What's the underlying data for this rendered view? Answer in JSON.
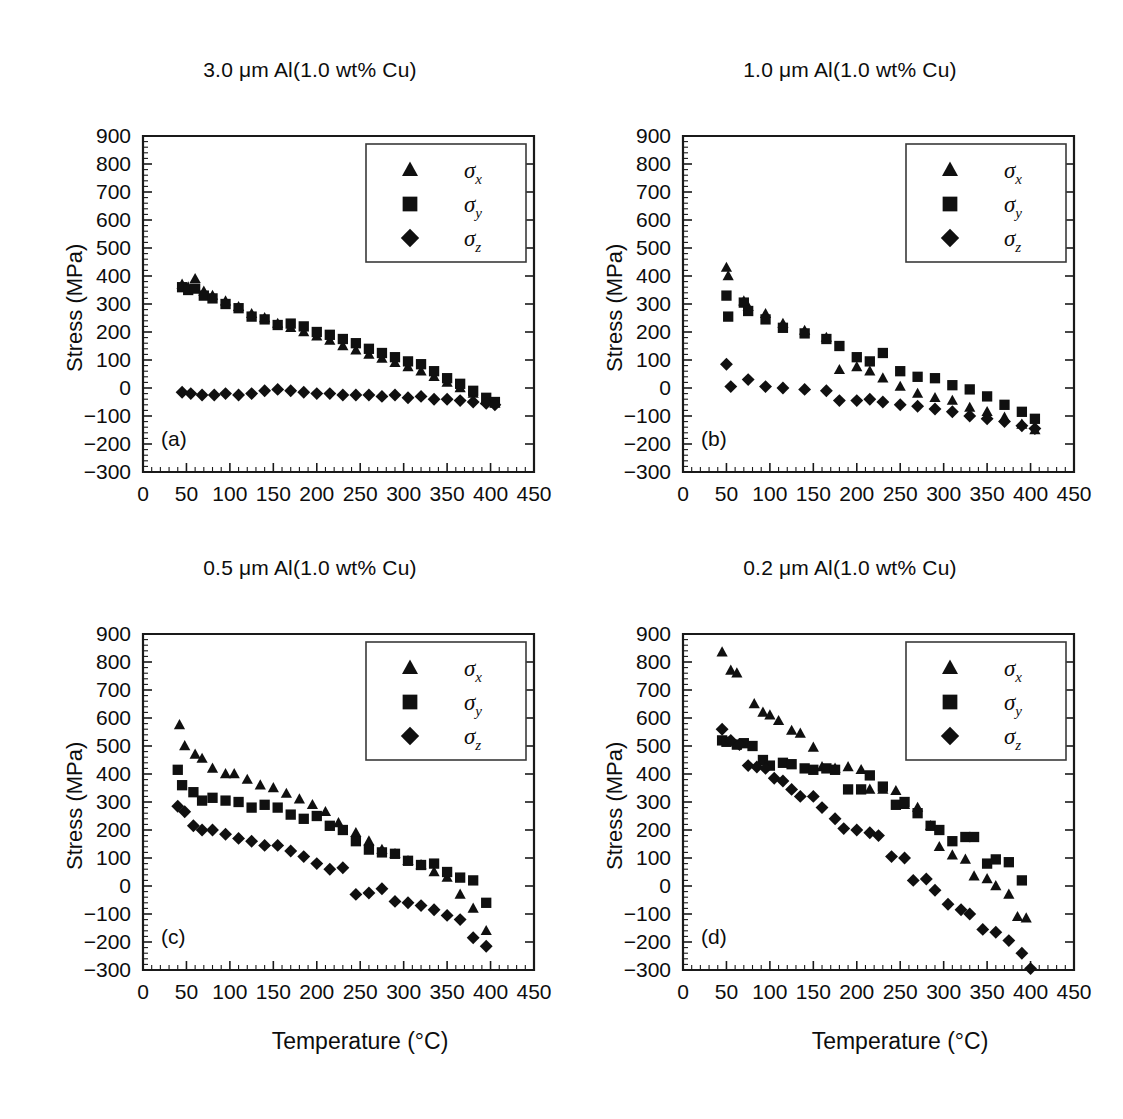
{
  "figure": {
    "background": "#ffffff",
    "marker_color": "#101010",
    "axis_color": "#1a1a1a"
  },
  "axes": {
    "xlabel": "Temperature (°C)",
    "ylabel": "Stress (MPa)",
    "xticks": [
      0,
      50,
      100,
      150,
      200,
      250,
      300,
      350,
      400,
      450
    ],
    "yticks": [
      900,
      800,
      700,
      600,
      500,
      400,
      300,
      200,
      100,
      0,
      -100,
      -200,
      -300
    ],
    "xlim": [
      0,
      450
    ],
    "ylim": [
      -300,
      900
    ],
    "xminor_per_major": 5,
    "yminor_per_major": 5,
    "grid": false
  },
  "legend": {
    "position": "top-right",
    "entries": [
      {
        "marker": "triangle",
        "symbol": "σ",
        "subscript": "x",
        "label": "σx"
      },
      {
        "marker": "square",
        "symbol": "σ",
        "subscript": "y",
        "label": "σy"
      },
      {
        "marker": "diamond",
        "symbol": "σ",
        "subscript": "z",
        "label": "σz"
      }
    ]
  },
  "panels": [
    {
      "letter": "(a)",
      "title": "3.0 μm Al(1.0 wt% Cu)"
    },
    {
      "letter": "(b)",
      "title": "1.0 μm Al(1.0 wt% Cu)"
    },
    {
      "letter": "(c)",
      "title": "0.5 μm Al(1.0 wt% Cu)"
    },
    {
      "letter": "(d)",
      "title": "0.2 μm Al(1.0 wt% Cu)"
    }
  ],
  "chart_data": [
    {
      "type": "scatter",
      "panel": "(a)",
      "title": "3.0 μm Al(1.0 wt% Cu)",
      "xlabel": "Temperature (°C)",
      "ylabel": "Stress (MPa)",
      "xlim": [
        0,
        450
      ],
      "ylim": [
        -300,
        900
      ],
      "legend": [
        "σx",
        "σy",
        "σz"
      ],
      "series": [
        {
          "name": "σx",
          "marker": "triangle",
          "x": [
            45,
            52,
            60,
            70,
            80,
            95,
            110,
            125,
            140,
            155,
            170,
            185,
            200,
            215,
            230,
            245,
            260,
            275,
            290,
            305,
            320,
            335,
            350,
            365,
            380,
            395,
            405
          ],
          "y": [
            370,
            360,
            390,
            345,
            330,
            310,
            290,
            265,
            250,
            230,
            215,
            200,
            185,
            170,
            150,
            135,
            120,
            105,
            90,
            75,
            60,
            40,
            20,
            0,
            -20,
            -45,
            -55
          ]
        },
        {
          "name": "σy",
          "marker": "square",
          "x": [
            45,
            52,
            60,
            70,
            80,
            95,
            110,
            125,
            140,
            155,
            170,
            185,
            200,
            215,
            230,
            245,
            260,
            275,
            290,
            305,
            320,
            335,
            350,
            365,
            380,
            395,
            405
          ],
          "y": [
            360,
            350,
            355,
            330,
            320,
            300,
            285,
            255,
            245,
            225,
            230,
            220,
            200,
            190,
            175,
            160,
            140,
            125,
            110,
            95,
            85,
            60,
            35,
            15,
            -10,
            -35,
            -50
          ]
        },
        {
          "name": "σz",
          "marker": "diamond",
          "x": [
            45,
            55,
            68,
            82,
            95,
            110,
            125,
            140,
            155,
            170,
            185,
            200,
            215,
            230,
            245,
            260,
            275,
            290,
            305,
            320,
            335,
            350,
            365,
            380,
            395,
            405
          ],
          "y": [
            -15,
            -20,
            -25,
            -25,
            -20,
            -25,
            -20,
            -10,
            -5,
            -10,
            -15,
            -20,
            -20,
            -25,
            -25,
            -25,
            -30,
            -25,
            -35,
            -30,
            -40,
            -40,
            -45,
            -50,
            -55,
            -60
          ]
        }
      ]
    },
    {
      "type": "scatter",
      "panel": "(b)",
      "title": "1.0 μm Al(1.0 wt% Cu)",
      "xlabel": "Temperature (°C)",
      "ylabel": "Stress (MPa)",
      "xlim": [
        0,
        450
      ],
      "ylim": [
        -300,
        900
      ],
      "legend": [
        "σx",
        "σy",
        "σz"
      ],
      "series": [
        {
          "name": "σx",
          "marker": "triangle",
          "x": [
            50,
            52,
            70,
            75,
            95,
            115,
            140,
            165,
            180,
            200,
            215,
            230,
            250,
            270,
            290,
            310,
            330,
            350,
            370,
            390,
            405
          ],
          "y": [
            430,
            400,
            310,
            290,
            265,
            230,
            205,
            180,
            65,
            75,
            60,
            35,
            5,
            -20,
            -35,
            -45,
            -70,
            -85,
            -105,
            -130,
            -150
          ]
        },
        {
          "name": "σy",
          "marker": "square",
          "x": [
            50,
            52,
            70,
            75,
            95,
            115,
            140,
            165,
            180,
            200,
            215,
            230,
            250,
            270,
            290,
            310,
            330,
            350,
            370,
            390,
            405
          ],
          "y": [
            330,
            255,
            305,
            275,
            245,
            215,
            195,
            175,
            150,
            110,
            95,
            125,
            60,
            40,
            35,
            10,
            -5,
            -30,
            -60,
            -85,
            -110
          ]
        },
        {
          "name": "σz",
          "marker": "diamond",
          "x": [
            50,
            55,
            75,
            95,
            115,
            140,
            165,
            180,
            200,
            215,
            230,
            250,
            270,
            290,
            310,
            330,
            350,
            370,
            390,
            405
          ],
          "y": [
            85,
            5,
            30,
            5,
            0,
            -5,
            -10,
            -45,
            -45,
            -40,
            -50,
            -60,
            -65,
            -75,
            -85,
            -100,
            -110,
            -120,
            -135,
            -145
          ]
        }
      ]
    },
    {
      "type": "scatter",
      "panel": "(c)",
      "title": "0.5 μm Al(1.0 wt% Cu)",
      "xlabel": "Temperature (°C)",
      "ylabel": "Stress (MPa)",
      "xlim": [
        0,
        450
      ],
      "ylim": [
        -300,
        900
      ],
      "legend": [
        "σx",
        "σy",
        "σz"
      ],
      "series": [
        {
          "name": "σx",
          "marker": "triangle",
          "x": [
            42,
            48,
            60,
            68,
            80,
            95,
            105,
            120,
            135,
            150,
            165,
            180,
            195,
            210,
            225,
            245,
            260,
            275,
            290,
            305,
            320,
            335,
            350,
            365,
            380,
            395
          ],
          "y": [
            575,
            500,
            470,
            455,
            420,
            400,
            400,
            380,
            360,
            350,
            330,
            310,
            290,
            265,
            225,
            190,
            160,
            130,
            115,
            90,
            75,
            50,
            30,
            -30,
            -80,
            -160
          ]
        },
        {
          "name": "σy",
          "marker": "square",
          "x": [
            40,
            45,
            58,
            68,
            80,
            95,
            110,
            125,
            140,
            155,
            170,
            185,
            200,
            215,
            230,
            245,
            260,
            275,
            290,
            305,
            320,
            335,
            350,
            365,
            380,
            395
          ],
          "y": [
            415,
            360,
            335,
            305,
            315,
            305,
            300,
            280,
            290,
            280,
            255,
            240,
            250,
            215,
            200,
            160,
            130,
            120,
            115,
            90,
            75,
            80,
            50,
            30,
            20,
            -60
          ]
        },
        {
          "name": "σz",
          "marker": "diamond",
          "x": [
            40,
            48,
            58,
            68,
            80,
            95,
            110,
            125,
            140,
            155,
            170,
            185,
            200,
            215,
            230,
            245,
            260,
            275,
            290,
            305,
            320,
            335,
            350,
            365,
            380,
            395
          ],
          "y": [
            285,
            265,
            215,
            200,
            200,
            185,
            170,
            160,
            145,
            145,
            125,
            105,
            80,
            60,
            65,
            -30,
            -25,
            -10,
            -55,
            -60,
            -70,
            -85,
            -105,
            -120,
            -185,
            -215
          ]
        }
      ]
    },
    {
      "type": "scatter",
      "panel": "(d)",
      "title": "0.2 μm Al(1.0 wt% Cu)",
      "xlabel": "Temperature (°C)",
      "ylabel": "Stress (MPa)",
      "xlim": [
        0,
        450
      ],
      "ylim": [
        -300,
        900
      ],
      "legend": [
        "σx",
        "σy",
        "σz"
      ],
      "series": [
        {
          "name": "σx",
          "marker": "triangle",
          "x": [
            45,
            55,
            62,
            82,
            92,
            100,
            110,
            125,
            135,
            150,
            160,
            175,
            190,
            205,
            215,
            230,
            245,
            255,
            270,
            285,
            295,
            310,
            325,
            335,
            350,
            360,
            375,
            385,
            395
          ],
          "y": [
            835,
            770,
            760,
            650,
            620,
            610,
            590,
            555,
            545,
            495,
            425,
            420,
            425,
            415,
            345,
            345,
            340,
            290,
            280,
            215,
            140,
            110,
            95,
            35,
            25,
            0,
            -30,
            -110,
            -115
          ]
        },
        {
          "name": "σy",
          "marker": "square",
          "x": [
            45,
            50,
            62,
            70,
            80,
            92,
            100,
            115,
            125,
            140,
            150,
            165,
            175,
            190,
            205,
            215,
            230,
            245,
            255,
            270,
            285,
            295,
            310,
            325,
            335,
            350,
            360,
            375,
            390
          ],
          "y": [
            520,
            515,
            505,
            510,
            500,
            450,
            430,
            440,
            435,
            420,
            415,
            420,
            415,
            345,
            345,
            395,
            355,
            290,
            300,
            260,
            215,
            200,
            160,
            175,
            175,
            80,
            95,
            85,
            20
          ]
        },
        {
          "name": "σz",
          "marker": "diamond",
          "x": [
            45,
            55,
            65,
            75,
            85,
            95,
            105,
            115,
            125,
            135,
            150,
            160,
            175,
            185,
            200,
            215,
            225,
            240,
            255,
            265,
            280,
            290,
            305,
            320,
            330,
            345,
            360,
            375,
            390,
            400
          ],
          "y": [
            560,
            520,
            505,
            430,
            425,
            420,
            385,
            375,
            345,
            320,
            320,
            280,
            240,
            205,
            200,
            190,
            180,
            105,
            100,
            20,
            25,
            -15,
            -65,
            -85,
            -100,
            -155,
            -165,
            -195,
            -240,
            -295
          ]
        }
      ]
    }
  ]
}
